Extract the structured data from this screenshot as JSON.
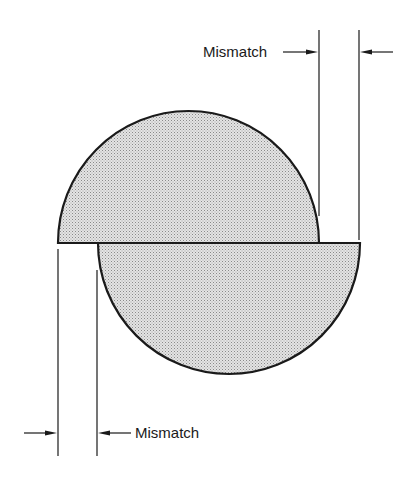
{
  "diagram": {
    "labels": {
      "top_mismatch": "Mismatch",
      "bottom_mismatch": "Mismatch"
    },
    "colors": {
      "stroke": "#1a1a1a",
      "fill": "#d6d6d6",
      "background": "#ffffff"
    },
    "shapes": [
      {
        "name": "upper-half-disc",
        "x_left": 58,
        "x_right": 319,
        "flat_y": 243,
        "top_y": 111
      },
      {
        "name": "lower-half-disc",
        "x_left": 98,
        "x_right": 360,
        "flat_y": 243,
        "bottom_y": 374
      }
    ]
  }
}
